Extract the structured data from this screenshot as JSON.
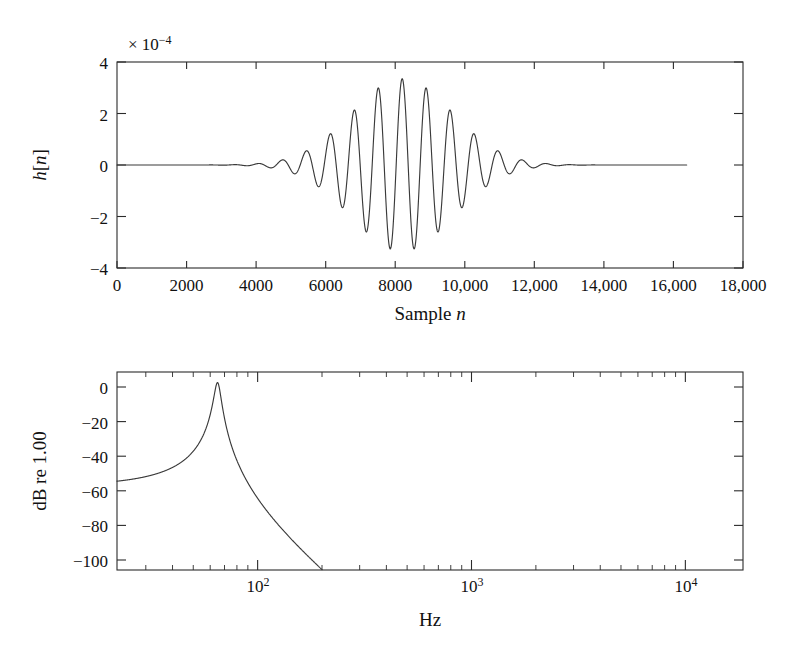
{
  "figure": {
    "name": "impulse-response-and-magnitude-response",
    "panels": [
      "top-impulse-response",
      "bottom-magnitude-response"
    ]
  },
  "top_panel": {
    "multiplier_prefix": "× 10",
    "multiplier_exponent": "−4",
    "ylabel_parts": {
      "h": "h",
      "bracket_open": "[",
      "n": "n",
      "bracket_close": "]"
    },
    "ylabel": "h[n]",
    "xlabel_text": "Sample ",
    "xlabel_italic": "n",
    "xlabel": "Sample n",
    "y_ticks": [
      "4",
      "2",
      "0",
      "−2",
      "−4"
    ],
    "x_ticks": [
      "0",
      "2000",
      "4000",
      "6000",
      "8000",
      "10,000",
      "12,000",
      "14,000",
      "16,000",
      "18,000"
    ]
  },
  "bottom_panel": {
    "ylabel": "dB re 1.00",
    "xlabel": "Hz",
    "y_ticks": [
      "0",
      "−20",
      "−40",
      "−60",
      "−80",
      "−100"
    ],
    "x_ticks": [
      {
        "mantissa": "10",
        "exponent": "2"
      },
      {
        "mantissa": "10",
        "exponent": "3"
      },
      {
        "mantissa": "10",
        "exponent": "4"
      }
    ]
  },
  "colors": {
    "curve": "#3a3a3a",
    "axis": "#2b2b2b",
    "background": "#ffffff",
    "text": "#111111"
  },
  "chart_data": [
    {
      "type": "line",
      "name": "impulse-response",
      "title": "",
      "xlabel": "Sample n",
      "ylabel": "h[n]",
      "y_scale_multiplier": 0.0001,
      "y_scale_label": "× 10−4",
      "xlim": [
        0,
        18000
      ],
      "ylim": [
        -4,
        4
      ],
      "xticks": [
        0,
        2000,
        4000,
        6000,
        8000,
        10000,
        12000,
        14000,
        16000,
        18000
      ],
      "xticklabels": [
        "0",
        "2000",
        "4000",
        "6000",
        "8000",
        "10,000",
        "12,000",
        "14,000",
        "16,000",
        "18,000"
      ],
      "yticks": [
        -4,
        -2,
        0,
        2,
        4
      ],
      "yticklabels": [
        "−4",
        "−2",
        "0",
        "2",
        "4"
      ],
      "grid": false,
      "legend": false,
      "data_extent_samples": [
        0,
        16384
      ],
      "description": "Gaussian-windowed modulated sinusoid (band-pass filter impulse response) centred near sample 8200, peak amplitude about 3.35e-4, envelope decaying to zero by sample ~15000.",
      "envelope_center_sample": 8200,
      "envelope_sigma_samples": 1450,
      "carrier_period_samples": 690,
      "peak_amplitude": 3.35,
      "x": [
        0,
        500,
        1000,
        1500,
        2000,
        2500,
        2800,
        3000,
        3200,
        3450,
        3700,
        3900,
        4150,
        4400,
        4600,
        4850,
        5100,
        5300,
        5550,
        5800,
        6000,
        6250,
        6500,
        6700,
        6950,
        7200,
        7400,
        7650,
        7900,
        8100,
        8350,
        8600,
        8800,
        9050,
        9300,
        9500,
        9750,
        10000,
        10200,
        10450,
        10700,
        10900,
        11150,
        11400,
        11600,
        11850,
        12100,
        12300,
        12550,
        12800,
        13000,
        13250,
        13500,
        13700,
        14000,
        14500,
        15000,
        15500,
        16000,
        16384
      ],
      "y": [
        0,
        0,
        0.01,
        -0.01,
        0.02,
        -0.03,
        0.05,
        0.0,
        -0.06,
        0.1,
        -0.13,
        0.0,
        0.16,
        -0.2,
        0.0,
        0.26,
        -0.33,
        0.0,
        0.45,
        -0.58,
        0.0,
        0.78,
        -1.0,
        0.0,
        1.45,
        -1.8,
        0.0,
        2.45,
        -2.9,
        0.0,
        3.35,
        -3.2,
        0.0,
        2.75,
        -2.5,
        0.0,
        1.85,
        -1.45,
        0.0,
        1.0,
        -0.82,
        0.0,
        0.55,
        -0.45,
        0.0,
        0.3,
        -0.25,
        0.0,
        0.16,
        -0.13,
        0.0,
        0.08,
        -0.06,
        0.0,
        0.03,
        0.01,
        0.0,
        0.0,
        0.0,
        0.0
      ]
    },
    {
      "type": "line",
      "name": "magnitude-response",
      "title": "",
      "xlabel": "Hz",
      "ylabel": "dB re 1.00",
      "xscale": "log",
      "xlim": [
        22,
        18600
      ],
      "ylim": [
        -106,
        6
      ],
      "xticks": [
        100,
        1000,
        10000
      ],
      "xticklabels": [
        "10²",
        "10³",
        "10⁴"
      ],
      "yticks": [
        0,
        -20,
        -40,
        -60,
        -80,
        -100
      ],
      "yticklabels": [
        "0",
        "−20",
        "−40",
        "−60",
        "−80",
        "−100"
      ],
      "grid": false,
      "legend": false,
      "description": "Narrow band-pass magnitude response peaking at 0 dB near 65 Hz; rises from about −99 dB at 22 Hz, flat-topped 0 dB plateau between roughly 58 and 75 Hz, then falls steeply below −106 dB (off-scale) past about 120 Hz.",
      "peak_frequency_hz": 65,
      "peak_db": 0,
      "x_hz": [
        22,
        25,
        28,
        32,
        36,
        40,
        44,
        48,
        52,
        55,
        58,
        60,
        62,
        65,
        68,
        71,
        74,
        77,
        80,
        84,
        88,
        93,
        98,
        104,
        110,
        116,
        120
      ],
      "y_db": [
        -99,
        -93,
        -87,
        -80,
        -73.5,
        -67,
        -60.5,
        -53,
        -42,
        -31,
        -12,
        -3.5,
        -0.6,
        -0.1,
        -0.3,
        -2.0,
        -9,
        -22,
        -35,
        -48,
        -58,
        -68,
        -78,
        -88,
        -98,
        -105,
        -108
      ]
    }
  ]
}
